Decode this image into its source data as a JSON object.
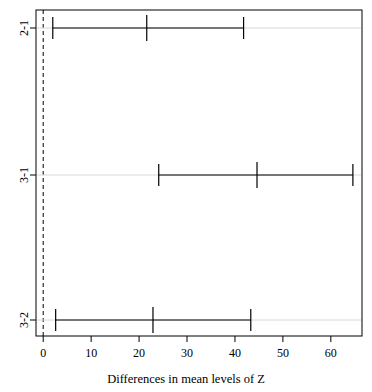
{
  "chart_data": {
    "type": "line",
    "title": "",
    "subtitle": "",
    "xlabel": "Differences in mean levels of Z",
    "ylabel": "",
    "xlim": [
      -1.5,
      66.5
    ],
    "grid": false,
    "legend": "none",
    "reference_line": {
      "value": 0,
      "style": "dashed"
    },
    "categories": [
      "2-1",
      "3-1",
      "3-2"
    ],
    "xticks": [
      0,
      10,
      20,
      30,
      40,
      50,
      60
    ],
    "xtick_labels": [
      "0",
      "10",
      "20",
      "30",
      "40",
      "50",
      "60"
    ],
    "ytick_labels": [
      "2-1",
      "3-1",
      "3-2"
    ],
    "series": [
      {
        "name": "2-1",
        "label": "2-1",
        "center": 21.6,
        "lower": 2.0,
        "upper": 41.8
      },
      {
        "name": "3-1",
        "label": "3-1",
        "center": 44.6,
        "lower": 24.1,
        "upper": 64.6
      },
      {
        "name": "3-2",
        "label": "3-2",
        "center": 22.9,
        "lower": 2.6,
        "upper": 43.3
      }
    ],
    "colors": {
      "line": "#000000",
      "box": "#000000",
      "reference": "#000000",
      "background": "#ffffff"
    }
  },
  "axis": {
    "x_title": "Differences in mean levels of Z",
    "ticks": [
      "0",
      "10",
      "20",
      "30",
      "40",
      "50",
      "60"
    ],
    "y_ticks": [
      "2-1",
      "3-1",
      "3-2"
    ]
  }
}
